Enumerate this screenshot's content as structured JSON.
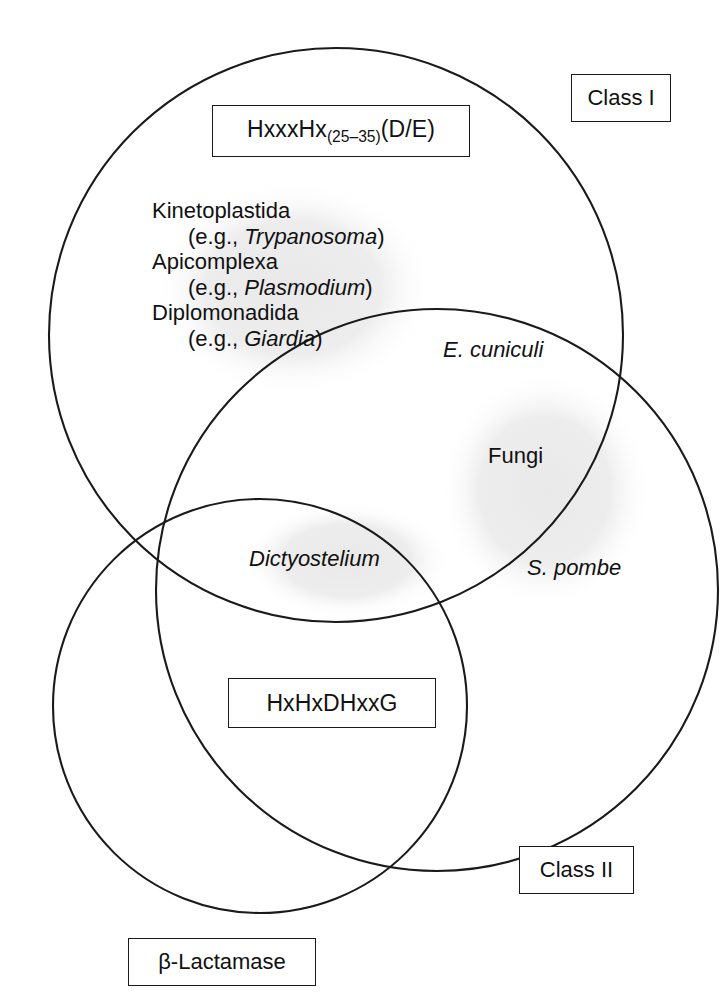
{
  "figure": {
    "type": "venn-diagram",
    "background_color": "#ffffff",
    "stroke_color": "#1a1a1a",
    "halo_color": "#ededed"
  },
  "circles": [
    {
      "name": "Class I",
      "cx": 336,
      "cy": 335,
      "r": 287
    },
    {
      "name": "Class II",
      "cx": 437,
      "cy": 590,
      "r": 281
    },
    {
      "name": "beta-Lactamase",
      "cx": 260,
      "cy": 706,
      "r": 207
    }
  ],
  "boxes": {
    "motif_class_1": {
      "prefix": "HxxxHx",
      "subscript": "(25–35)",
      "suffix": "(D/E)"
    },
    "motif_class_2": {
      "label": "HxHxDHxxG"
    },
    "class_1": {
      "label": "Class I"
    },
    "class_2": {
      "label": "Class II"
    },
    "blactamase": {
      "label": "β-Lactamase"
    }
  },
  "taxa": [
    {
      "group": "Kinetoplastida",
      "example": "(e.g., ",
      "genus": "Trypanosoma",
      "example_close": ")"
    },
    {
      "group": "Apicomplexa",
      "example": "(e.g., ",
      "genus": "Plasmodium",
      "example_close": ")"
    },
    {
      "group": "Diplomonadida",
      "example": "(e.g., ",
      "genus": "Giardia",
      "example_close": ")"
    }
  ],
  "labels": {
    "e_cuniculi": "E. cuniculi",
    "fungi": "Fungi",
    "s_pombe": "S. pombe",
    "dictyostelium": "Dictyostelium"
  }
}
